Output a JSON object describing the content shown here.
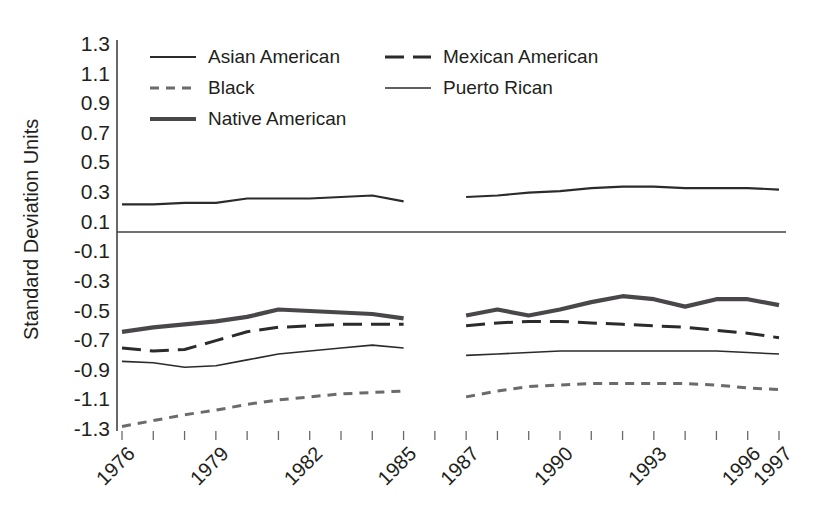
{
  "chart_data": {
    "type": "line",
    "title": "",
    "xlabel": "",
    "ylabel": "Standard Deviation Units",
    "ylim": [
      -1.3,
      1.3
    ],
    "ytick_labels": [
      "1.3",
      "1.1",
      "0.9",
      "0.7",
      "0.5",
      "0.3",
      "0.1",
      "-0.1",
      "-0.3",
      "-0.5",
      "-0.7",
      "-0.9",
      "-1.1",
      "-1.3"
    ],
    "ytick_values": [
      1.3,
      1.1,
      0.9,
      0.7,
      0.5,
      0.3,
      0.1,
      -0.1,
      -0.3,
      -0.5,
      -0.7,
      -0.9,
      -1.1,
      -1.3
    ],
    "xlim": [
      1976,
      1997
    ],
    "x": [
      1976,
      1977,
      1978,
      1979,
      1980,
      1981,
      1982,
      1983,
      1984,
      1985,
      1987,
      1988,
      1989,
      1990,
      1991,
      1992,
      1993,
      1994,
      1995,
      1996,
      1997
    ],
    "xtick_values": [
      1976,
      1977,
      1978,
      1979,
      1980,
      1981,
      1982,
      1983,
      1984,
      1985,
      1986,
      1987,
      1988,
      1989,
      1990,
      1991,
      1992,
      1993,
      1994,
      1995,
      1996,
      1997
    ],
    "xtick_labels": [
      "1976",
      "",
      "",
      "1979",
      "",
      "",
      "1982",
      "",
      "",
      "1985",
      "",
      "1987",
      "",
      "",
      "1990",
      "",
      "",
      "1993",
      "",
      "",
      "1996",
      "1997"
    ],
    "grid": false,
    "zero_line": true,
    "gap_years": [
      1986
    ],
    "legend_position": "top-left-inside",
    "series": [
      {
        "name": "Asian American",
        "style": "solid",
        "color": "#2b2b2b",
        "width": 2.1,
        "values": [
          0.21,
          0.21,
          0.22,
          0.22,
          0.25,
          0.25,
          0.25,
          0.26,
          0.27,
          0.23,
          0.26,
          0.27,
          0.29,
          0.3,
          0.32,
          0.33,
          0.33,
          0.32,
          0.32,
          0.32,
          0.31
        ]
      },
      {
        "name": "Black",
        "style": "dashed-short",
        "color": "#6d6a6d",
        "width": 3.0,
        "values": [
          -1.29,
          -1.25,
          -1.21,
          -1.18,
          -1.14,
          -1.11,
          -1.09,
          -1.07,
          -1.06,
          -1.05,
          -1.09,
          -1.05,
          -1.02,
          -1.01,
          -1.0,
          -1.0,
          -1.0,
          -1.0,
          -1.01,
          -1.03,
          -1.04
        ]
      },
      {
        "name": "Native American",
        "style": "solid-thick",
        "color": "#4a474a",
        "width": 4.2,
        "values": [
          -0.65,
          -0.62,
          -0.6,
          -0.58,
          -0.55,
          -0.5,
          -0.51,
          -0.52,
          -0.53,
          -0.56,
          -0.54,
          -0.5,
          -0.54,
          -0.5,
          -0.45,
          -0.41,
          -0.43,
          -0.48,
          -0.43,
          -0.43,
          -0.47
        ]
      },
      {
        "name": "Mexican American",
        "style": "dashed-long",
        "color": "#2b2b2b",
        "width": 3.0,
        "values": [
          -0.76,
          -0.78,
          -0.77,
          -0.71,
          -0.65,
          -0.62,
          -0.61,
          -0.6,
          -0.6,
          -0.6,
          -0.61,
          -0.59,
          -0.58,
          -0.58,
          -0.59,
          -0.6,
          -0.61,
          -0.62,
          -0.64,
          -0.66,
          -0.69
        ]
      },
      {
        "name": "Puerto Rican",
        "style": "solid-thin",
        "color": "#2b2b2b",
        "width": 1.6,
        "values": [
          -0.85,
          -0.86,
          -0.89,
          -0.88,
          -0.84,
          -0.8,
          -0.78,
          -0.76,
          -0.74,
          -0.76,
          -0.81,
          -0.8,
          -0.79,
          -0.78,
          -0.78,
          -0.78,
          -0.78,
          -0.78,
          -0.78,
          -0.79,
          -0.8
        ]
      }
    ]
  },
  "legend": {
    "entries": [
      {
        "label": "Asian American",
        "key": "asian-american"
      },
      {
        "label": "Mexican American",
        "key": "mexican-american"
      },
      {
        "label": "Black",
        "key": "black"
      },
      {
        "label": "Puerto Rican",
        "key": "puerto-rican"
      },
      {
        "label": "Native American",
        "key": "native-american"
      }
    ]
  },
  "axes": {
    "y_axis_title": "Standard Deviation Units"
  }
}
